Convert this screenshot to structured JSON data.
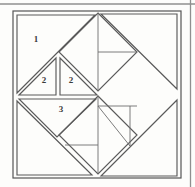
{
  "figure": {
    "type": "geometric-diagram",
    "canvas": {
      "width": 195,
      "height": 187
    },
    "colors": {
      "background": "#fdfdfb",
      "stroke_dark": "#4a4a4a",
      "stroke_mid": "#6d6d6d",
      "stroke_light": "#a8a8a8",
      "frame_outer": "#8f8f8f",
      "frame_inner": "#555555",
      "label_text": "#3a3a3a"
    },
    "frame": {
      "outer_top_rule": {
        "x1": 0,
        "y1": 4,
        "x2": 195,
        "y2": 4
      },
      "outer_right_rule": {
        "x1": 190,
        "y1": 0,
        "x2": 190,
        "y2": 187
      },
      "inner_rect": {
        "x": 13,
        "y": 11,
        "width": 168,
        "height": 167
      }
    },
    "labels": [
      {
        "id": "label-1",
        "text": "1",
        "x": 36,
        "y": 40
      },
      {
        "id": "label-2a",
        "text": "2",
        "x": 44,
        "y": 80
      },
      {
        "id": "label-2b",
        "text": "2",
        "x": 70,
        "y": 80
      },
      {
        "id": "label-3",
        "text": "3",
        "x": 61,
        "y": 108
      }
    ],
    "pieces": [
      {
        "name": "large-triangle-1",
        "label": "1",
        "points": "17,15 17,93 95,15"
      },
      {
        "name": "small-triangle-2a",
        "label": "2",
        "points": "19,95 56,58 56,95"
      },
      {
        "name": "small-triangle-2b",
        "label": "2",
        "points": "59,58 96,95 59,95"
      },
      {
        "name": "medium-triangle-3",
        "label": "3",
        "points": "19,98 96,98 58,136"
      },
      {
        "name": "large-triangle-bottom-left",
        "points": "17,100 17,175 93,175"
      },
      {
        "name": "large-triangle-bottom-right",
        "points": "100,177 177,177 177,100"
      },
      {
        "name": "large-triangle-top-right",
        "points": "100,13 177,13 177,90"
      },
      {
        "name": "diamond-top-center",
        "points": "98,12 138,52 98,92 58,52"
      },
      {
        "name": "diamond-bottom-center",
        "points": "98,95 138,135 98,175 58,135"
      }
    ],
    "internal_lines": [
      {
        "name": "top-diamond-vertical",
        "x1": 98,
        "y1": 12,
        "x2": 98,
        "y2": 92
      },
      {
        "name": "top-diamond-horizontal",
        "x1": 98,
        "y1": 52,
        "x2": 138,
        "y2": 52
      },
      {
        "name": "bottom-diamond-vertical-right",
        "x1": 130,
        "y1": 103,
        "x2": 130,
        "y2": 143
      },
      {
        "name": "bottom-diamond-horizontal-top",
        "x1": 98,
        "y1": 103,
        "x2": 138,
        "y2": 103
      },
      {
        "name": "bottom-diamond-horizontal-low",
        "x1": 66,
        "y1": 143,
        "x2": 98,
        "y2": 143
      },
      {
        "name": "bottom-diamond-vertical-left",
        "x1": 98,
        "y1": 95,
        "x2": 98,
        "y2": 175
      },
      {
        "name": "small-triangle-divider",
        "x1": 57,
        "y1": 58,
        "x2": 57,
        "y2": 95
      }
    ]
  }
}
